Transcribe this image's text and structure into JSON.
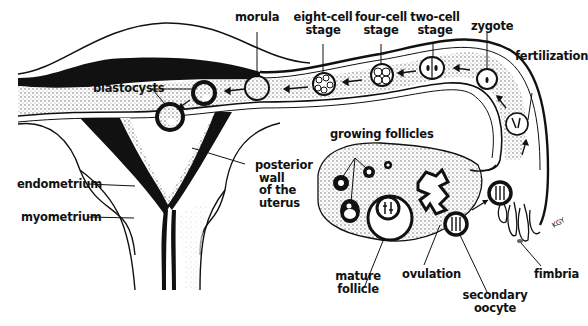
{
  "diagram": {
    "labels": {
      "morula": "morula",
      "eight_cell_1": "eight-cell",
      "eight_cell_2": "stage",
      "four_cell_1": "four-cell",
      "four_cell_2": "stage",
      "two_cell_1": "two-cell",
      "two_cell_2": "stage",
      "zygote": "zygote",
      "fertilization": "fertilization",
      "blastocysts": "blastocysts",
      "growing_follicles": "growing follicles",
      "posterior_1": "posterior",
      "posterior_2": "wall",
      "posterior_3": "of the",
      "posterior_4": "uterus",
      "endometrium": "endometrium",
      "myometrium": "myometrium",
      "mature_1": "mature",
      "mature_2": "follicle",
      "ovulation": "ovulation",
      "secondary_1": "secondary",
      "secondary_2": "oocyte",
      "fimbria": "fimbria",
      "signature": "KGY"
    },
    "colors": {
      "ink": "#111111",
      "paper": "#ffffff",
      "stipple": "#d8d8d8"
    }
  }
}
